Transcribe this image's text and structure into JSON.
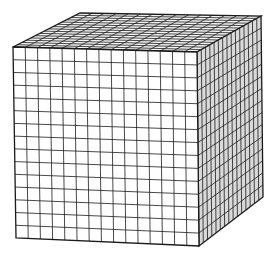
{
  "diagram": {
    "title": "",
    "divisions": 15,
    "stroke_color": "#1a1a1a",
    "faces": {
      "front": {
        "fill": "#ffffff",
        "corners": [
          [
            13,
            47
          ],
          [
            197,
            52
          ],
          [
            199,
            246
          ],
          [
            16,
            238
          ]
        ]
      },
      "top": {
        "fill": "#f4f4f4",
        "corners": [
          [
            80,
            13
          ],
          [
            261,
            16
          ],
          [
            197,
            52
          ],
          [
            13,
            47
          ]
        ]
      },
      "right": {
        "fill": "#d9d9d9",
        "corners": [
          [
            197,
            52
          ],
          [
            261,
            16
          ],
          [
            263,
            197
          ],
          [
            199,
            246
          ]
        ]
      }
    }
  }
}
